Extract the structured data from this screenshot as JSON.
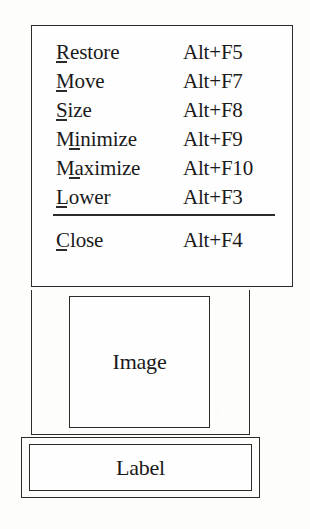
{
  "figure": {
    "background_color": "#fdfdfc",
    "ink_color": "#2b2b2b"
  },
  "window_menu": {
    "name": "window-operations-menu",
    "items": [
      {
        "label": "Restore",
        "accelerator": "Alt+F5",
        "mnemonic_index": 0,
        "mnemonic_char": "R",
        "separator_after": false
      },
      {
        "label": "Move",
        "accelerator": "Alt+F7",
        "mnemonic_index": 0,
        "mnemonic_char": "M",
        "separator_after": false
      },
      {
        "label": "Size",
        "accelerator": "Alt+F8",
        "mnemonic_index": 0,
        "mnemonic_char": "S",
        "separator_after": false
      },
      {
        "label": "Minimize",
        "accelerator": "Alt+F9",
        "mnemonic_index": 1,
        "mnemonic_char": "n",
        "separator_after": false
      },
      {
        "label": "Maximize",
        "accelerator": "Alt+F10",
        "mnemonic_index": 1,
        "mnemonic_char": "a",
        "separator_after": false
      },
      {
        "label": "Lower",
        "accelerator": "Alt+F3",
        "mnemonic_index": 0,
        "mnemonic_char": "L",
        "separator_after": true
      },
      {
        "label": "Close",
        "accelerator": "Alt+F4",
        "mnemonic_index": 0,
        "mnemonic_char": "C",
        "separator_after": false
      }
    ]
  },
  "image_widget": {
    "name": "image-placeholder",
    "text": "Image"
  },
  "label_widget": {
    "name": "label-placeholder",
    "text": "Label"
  }
}
